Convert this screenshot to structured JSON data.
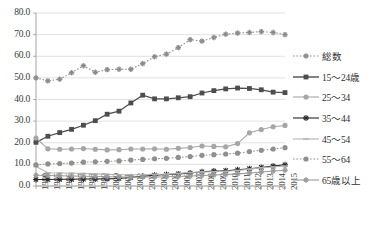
{
  "chart_data": {
    "type": "line",
    "title": "",
    "xlabel": "",
    "ylabel": "",
    "ylim": [
      0,
      80
    ],
    "ytick_step": 10,
    "grid": true,
    "legend_position": "right",
    "yticks": [
      "0.0",
      "10.0",
      "20.0",
      "30.0",
      "40.0",
      "50.0",
      "60.0",
      "70.0",
      "80.0"
    ],
    "categories": [
      "1990",
      "1995",
      "1996",
      "1997",
      "1998",
      "1999",
      "2000",
      "2001",
      "2002",
      "2003",
      "2004",
      "2005",
      "2006",
      "2007",
      "2008",
      "2009",
      "2010",
      "2011",
      "2012",
      "2013",
      "2014",
      "2015"
    ],
    "series": [
      {
        "name": "総数",
        "color": "#8c8c8c",
        "marker": "plus",
        "dash": "dotted",
        "values": [
          50.0,
          48.6,
          49.4,
          52.4,
          55.6,
          52.6,
          53.8,
          54.0,
          54.0,
          56.6,
          59.8,
          61.0,
          64.0,
          67.7,
          67.0,
          68.7,
          70.2,
          70.7,
          71.0,
          71.4,
          71.0,
          70.0
        ]
      },
      {
        "name": "15～24歳",
        "color": "#4d4d4d",
        "marker": "square",
        "dash": "solid",
        "values": [
          20.2,
          23.0,
          24.7,
          26.2,
          28.1,
          30.2,
          33.2,
          34.6,
          38.4,
          42.0,
          40.3,
          40.3,
          40.8,
          41.3,
          43.0,
          44.1,
          44.9,
          45.3,
          45.1,
          44.5,
          43.4,
          43.2
        ]
      },
      {
        "name": "25～34",
        "color": "#a6a6a6",
        "marker": "circle",
        "dash": "solid",
        "values": [
          22.2,
          17.2,
          17.0,
          17.1,
          17.3,
          17.0,
          16.7,
          16.8,
          17.1,
          17.1,
          17.2,
          17.0,
          17.4,
          17.8,
          18.5,
          18.3,
          18.1,
          19.6,
          24.6,
          26.1,
          27.4,
          28.0
        ]
      },
      {
        "name": "35～44",
        "color": "#262626",
        "marker": "star",
        "dash": "solid",
        "values": [
          3.0,
          3.0,
          3.1,
          3.1,
          3.2,
          3.2,
          3.3,
          3.5,
          4.0,
          4.5,
          5.0,
          5.3,
          5.6,
          6.0,
          6.6,
          6.9,
          7.1,
          7.5,
          8.0,
          8.6,
          9.2,
          9.8
        ]
      },
      {
        "name": "45～54",
        "color": "#b3b3b3",
        "marker": "dash",
        "dash": "solid",
        "values": [
          9.0,
          6.1,
          6.0,
          5.9,
          5.8,
          5.6,
          5.4,
          5.2,
          5.2,
          5.2,
          5.4,
          5.5,
          5.8,
          6.2,
          6.5,
          6.6,
          6.8,
          7.2,
          7.8,
          8.4,
          8.8,
          9.2
        ]
      },
      {
        "name": "55～64",
        "color": "#8f8f8f",
        "marker": "circle",
        "dash": "dotted",
        "values": [
          9.8,
          10.2,
          10.4,
          10.6,
          11.0,
          11.2,
          11.4,
          11.6,
          12.0,
          12.3,
          12.6,
          12.8,
          13.2,
          13.6,
          14.2,
          14.5,
          14.8,
          15.2,
          15.9,
          16.5,
          17.1,
          17.7
        ]
      },
      {
        "name": "65歳以上",
        "color": "#9a9a9a",
        "marker": "plus",
        "dash": "solid",
        "values": [
          5.0,
          4.9,
          4.7,
          4.6,
          4.5,
          4.4,
          4.3,
          4.2,
          4.1,
          4.2,
          4.2,
          4.3,
          4.4,
          4.6,
          4.9,
          5.1,
          5.3,
          5.6,
          6.0,
          6.5,
          6.9,
          7.3
        ]
      }
    ]
  },
  "plot": {
    "left": 36,
    "top": 13,
    "right": 285,
    "bottom": 186
  },
  "legend": {
    "items": [
      {
        "label": "総数"
      },
      {
        "label": "15～24歳"
      },
      {
        "label": "25～34"
      },
      {
        "label": "35～44"
      },
      {
        "label": "45～54"
      },
      {
        "label": "55～64"
      },
      {
        "label": "65歳以上"
      }
    ]
  }
}
